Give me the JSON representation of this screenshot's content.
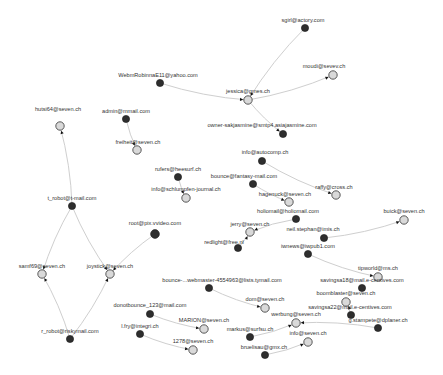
{
  "graph": {
    "colors": {
      "edge": "#cfcfcf",
      "source_node": "#2e2e2e",
      "target_node": "#d9d9d9",
      "arrow": "#111111"
    },
    "nodes": [
      {
        "id": "n1",
        "label": "WebmRobinnaE11@yahoo.com",
        "x": 160,
        "y": 83,
        "r": 3.6,
        "type": "dark",
        "lx": 158,
        "ly": 77
      },
      {
        "id": "n2",
        "label": "sgirl@actory.com",
        "x": 305,
        "y": 28,
        "r": 3.6,
        "type": "dark",
        "lx": 303,
        "ly": 22
      },
      {
        "id": "n3",
        "label": "moudi@sevev.ch",
        "x": 333,
        "y": 75,
        "r": 4.2,
        "type": "light",
        "lx": 324,
        "ly": 68
      },
      {
        "id": "n4",
        "label": "jessica@gmes.ch",
        "x": 248,
        "y": 100,
        "r": 4.2,
        "type": "light",
        "lx": 248,
        "ly": 93
      },
      {
        "id": "n5",
        "label": "owner-sakjasmine@smtp4.asiajasmine.com",
        "x": 283,
        "y": 134,
        "r": 3.6,
        "type": "dark",
        "lx": 262,
        "ly": 127
      },
      {
        "id": "n6",
        "label": "hutsi64@seven.ch",
        "x": 60,
        "y": 126,
        "r": 4.2,
        "type": "light",
        "lx": 58,
        "ly": 111
      },
      {
        "id": "n7",
        "label": "admin@mmail.com",
        "x": 126,
        "y": 119,
        "r": 3.6,
        "type": "dark",
        "lx": 126,
        "ly": 113
      },
      {
        "id": "n8",
        "label": "freiheit@seven.ch",
        "x": 137,
        "y": 150,
        "r": 4.2,
        "type": "light",
        "lx": 138,
        "ly": 144
      },
      {
        "id": "n9",
        "label": "rufers@heesurf.ch",
        "x": 178,
        "y": 177,
        "r": 3.6,
        "type": "dark",
        "lx": 178,
        "ly": 171
      },
      {
        "id": "n10",
        "label": "info@schlumpfen-journal.ch",
        "x": 186,
        "y": 198,
        "r": 4.2,
        "type": "light",
        "lx": 186,
        "ly": 191
      },
      {
        "id": "n11",
        "label": "info@autocomp.ch",
        "x": 262,
        "y": 161,
        "r": 3.6,
        "type": "dark",
        "lx": 265,
        "ly": 154
      },
      {
        "id": "n12",
        "label": "bounce@fantasy-mail.com",
        "x": 253,
        "y": 184,
        "r": 3.6,
        "type": "dark",
        "lx": 244,
        "ly": 178
      },
      {
        "id": "n13",
        "label": "hagenuck@seven.ch",
        "x": 289,
        "y": 202,
        "r": 4.2,
        "type": "light",
        "lx": 285,
        "ly": 196
      },
      {
        "id": "n14",
        "label": "raffy@cross.ch",
        "x": 336,
        "y": 195,
        "r": 4.2,
        "type": "light",
        "lx": 334,
        "ly": 189
      },
      {
        "id": "n15",
        "label": "holiomail@holiomail.com",
        "x": 296,
        "y": 219,
        "r": 3.6,
        "type": "dark",
        "lx": 288,
        "ly": 213
      },
      {
        "id": "n16",
        "label": "jerry@seven.ch",
        "x": 250,
        "y": 232,
        "r": 4.2,
        "type": "light",
        "lx": 250,
        "ly": 226
      },
      {
        "id": "n17",
        "label": "redlight@free.nl",
        "x": 238,
        "y": 248,
        "r": 3.6,
        "type": "dark",
        "lx": 224,
        "ly": 244
      },
      {
        "id": "n18",
        "label": "neil.stephan@imis.ch",
        "x": 324,
        "y": 238,
        "r": 3.6,
        "type": "dark",
        "lx": 313,
        "ly": 231
      },
      {
        "id": "n19",
        "label": "buick@seven.ch",
        "x": 404,
        "y": 220,
        "r": 4.2,
        "type": "light",
        "lx": 404,
        "ly": 213
      },
      {
        "id": "n20",
        "label": "root@pix.vvideo.com",
        "x": 155,
        "y": 234,
        "r": 4.4,
        "type": "dark",
        "lx": 155,
        "ly": 225
      },
      {
        "id": "n21",
        "label": "t_robot@t-mail.com",
        "x": 72,
        "y": 206,
        "r": 3.6,
        "type": "dark",
        "lx": 72,
        "ly": 200
      },
      {
        "id": "n22",
        "label": "samf69@seven.ch",
        "x": 42,
        "y": 274,
        "r": 4.2,
        "type": "light",
        "lx": 42,
        "ly": 268
      },
      {
        "id": "n23",
        "label": "joystick@seven.ch",
        "x": 110,
        "y": 274,
        "r": 4.2,
        "type": "light",
        "lx": 110,
        "ly": 268
      },
      {
        "id": "n24",
        "label": "r_robot@riskymail.com",
        "x": 70,
        "y": 339,
        "r": 3.6,
        "type": "dark",
        "lx": 70,
        "ly": 333
      },
      {
        "id": "n25",
        "label": "bounce-...webmaster-4554963@lists.tymail.com",
        "x": 209,
        "y": 288,
        "r": 3.6,
        "type": "dark",
        "lx": 222,
        "ly": 282
      },
      {
        "id": "n26",
        "label": "dom@seven.ch",
        "x": 265,
        "y": 308,
        "r": 4.2,
        "type": "light",
        "lx": 265,
        "ly": 301
      },
      {
        "id": "n27",
        "label": "donotbounce_123@mail.com",
        "x": 150,
        "y": 314,
        "r": 3.6,
        "type": "dark",
        "lx": 150,
        "ly": 307
      },
      {
        "id": "n28",
        "label": "MARION@seven.ch",
        "x": 204,
        "y": 329,
        "r": 4.2,
        "type": "light",
        "lx": 204,
        "ly": 322
      },
      {
        "id": "n29",
        "label": "l.fry@integri.ch",
        "x": 140,
        "y": 334,
        "r": 3.6,
        "type": "dark",
        "lx": 140,
        "ly": 328
      },
      {
        "id": "n30",
        "label": "1278@seven.ch",
        "x": 193,
        "y": 350,
        "r": 4.2,
        "type": "light",
        "lx": 193,
        "ly": 343
      },
      {
        "id": "n31",
        "label": "iwnews@iwpub1.com",
        "x": 308,
        "y": 254,
        "r": 3.6,
        "type": "dark",
        "lx": 308,
        "ly": 248
      },
      {
        "id": "n32",
        "label": "tipworld@ms.ch",
        "x": 378,
        "y": 277,
        "r": 4.2,
        "type": "light",
        "lx": 378,
        "ly": 270
      },
      {
        "id": "n33",
        "label": "savingsa18@mail.e-centives.com",
        "x": 362,
        "y": 288,
        "r": 3.6,
        "type": "dark",
        "lx": 362,
        "ly": 282
      },
      {
        "id": "n34",
        "label": "boomblaster@seven.ch",
        "x": 346,
        "y": 302,
        "r": 4.2,
        "type": "light",
        "lx": 346,
        "ly": 295
      },
      {
        "id": "n35",
        "label": "savingsa22@mail.e-centives.com",
        "x": 351,
        "y": 315,
        "r": 3.6,
        "type": "dark",
        "lx": 350,
        "ly": 309
      },
      {
        "id": "n36",
        "label": "g.stampete@dplaner.ch",
        "x": 378,
        "y": 328,
        "r": 3.6,
        "type": "dark",
        "lx": 378,
        "ly": 322
      },
      {
        "id": "n37",
        "label": "werbung@seven.ch",
        "x": 296,
        "y": 323,
        "r": 4.2,
        "type": "light",
        "lx": 296,
        "ly": 316
      },
      {
        "id": "n38",
        "label": "markus@surfsu.ch",
        "x": 250,
        "y": 337,
        "r": 3.6,
        "type": "dark",
        "lx": 250,
        "ly": 331
      },
      {
        "id": "n39",
        "label": "info@seven.ch",
        "x": 308,
        "y": 342,
        "r": 4.2,
        "type": "light",
        "lx": 308,
        "ly": 335
      },
      {
        "id": "n40",
        "label": "bruelisau@gmx.ch",
        "x": 265,
        "y": 355,
        "r": 3.6,
        "type": "dark",
        "lx": 264,
        "ly": 349
      }
    ],
    "edges": [
      {
        "from": "n1",
        "to": "n4"
      },
      {
        "from": "n2",
        "to": "n4"
      },
      {
        "from": "n4",
        "to": "n3"
      },
      {
        "from": "n4",
        "to": "n5"
      },
      {
        "from": "n21",
        "to": "n6"
      },
      {
        "from": "n7",
        "to": "n8"
      },
      {
        "from": "n9",
        "to": "n10"
      },
      {
        "from": "n11",
        "to": "n14"
      },
      {
        "from": "n12",
        "to": "n13"
      },
      {
        "from": "n15",
        "to": "n16"
      },
      {
        "from": "n17",
        "to": "n16"
      },
      {
        "from": "n18",
        "to": "n19"
      },
      {
        "from": "n20",
        "to": "n23"
      },
      {
        "from": "n21",
        "to": "n22"
      },
      {
        "from": "n21",
        "to": "n23"
      },
      {
        "from": "n24",
        "to": "n22"
      },
      {
        "from": "n24",
        "to": "n23"
      },
      {
        "from": "n25",
        "to": "n26"
      },
      {
        "from": "n27",
        "to": "n28"
      },
      {
        "from": "n29",
        "to": "n30"
      },
      {
        "from": "n31",
        "to": "n32"
      },
      {
        "from": "n35",
        "to": "n34"
      },
      {
        "from": "n36",
        "to": "n37"
      },
      {
        "from": "n38",
        "to": "n37"
      },
      {
        "from": "n40",
        "to": "n39"
      }
    ]
  }
}
